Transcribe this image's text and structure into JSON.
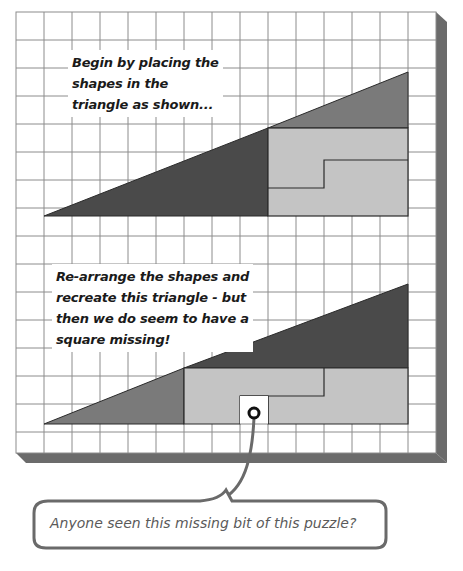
{
  "captions": {
    "top": [
      "Begin by placing the",
      "shapes in the",
      "triangle as shown..."
    ],
    "bottom": [
      "Re-arrange the shapes and",
      "recreate this triangle - but",
      "then we do seem to have a",
      "square missing!"
    ]
  },
  "bubble": {
    "text": "Anyone seen this missing bit of this puzzle?"
  },
  "colors": {
    "grid_line": "#8c8c8c",
    "board_shadow": "#6b6b6b",
    "dark_triangle": "#4a4a4a",
    "medium_triangle": "#7a7a7a",
    "light_block": "#c4c4c4",
    "outline": "#2a2a2a",
    "bubble_stroke": "#6a6a6a"
  },
  "grid": {
    "cell_px": 28,
    "columns": 15,
    "rows": 16
  }
}
